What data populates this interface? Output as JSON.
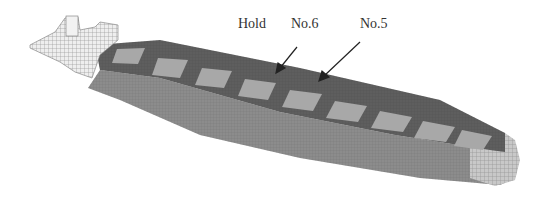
{
  "figure": {
    "labels": {
      "hold": "Hold",
      "no6": "No.6",
      "no5": "No.5"
    },
    "colors": {
      "deck": "#5e5e5e",
      "hatch": "#a8a8a8",
      "hull_side": "#8a8a8a",
      "superstructure": "#e6e6e6",
      "mesh_line": "#7a7a7a",
      "text": "#333333"
    },
    "hatch_count": 9
  }
}
